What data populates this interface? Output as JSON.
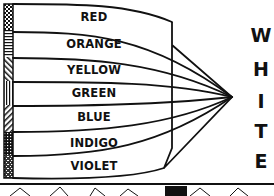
{
  "diagram": {
    "bands": [
      {
        "label": "RED",
        "pattern": "checker"
      },
      {
        "label": "ORANGE",
        "pattern": "horizontal-lines"
      },
      {
        "label": "YELLOW",
        "pattern": "diagonal-lines"
      },
      {
        "label": "GREEN",
        "pattern": "vertical-lines"
      },
      {
        "label": "BLUE",
        "pattern": "diagonal-lines-reverse"
      },
      {
        "label": "INDIGO",
        "pattern": "grid-dots"
      },
      {
        "label": "VIOLET",
        "pattern": "stipple"
      }
    ],
    "result_letters": [
      "W",
      "H",
      "I",
      "T",
      "E"
    ],
    "result_word": "WHITE",
    "colors": {
      "ink": "#111111",
      "background": "#ffffff"
    }
  }
}
